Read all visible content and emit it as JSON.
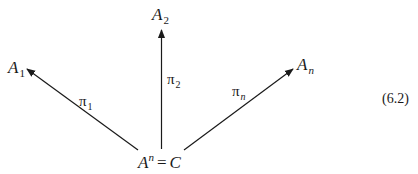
{
  "diagram": {
    "type": "product cone",
    "apex": {
      "base": "A",
      "superscript": "n",
      "equals": "=",
      "rhs": "C"
    },
    "targets": [
      {
        "base": "A",
        "subscript": "1"
      },
      {
        "base": "A",
        "subscript": "2"
      },
      {
        "base": "A",
        "subscript": "n"
      }
    ],
    "projections": [
      {
        "symbol": "π",
        "subscript": "1",
        "from": "AⁿC",
        "to": "A1"
      },
      {
        "symbol": "π",
        "subscript": "2",
        "from": "AⁿC",
        "to": "A2"
      },
      {
        "symbol": "π",
        "subscript": "n",
        "from": "AⁿC",
        "to": "An"
      }
    ],
    "equation_number": "(6.2)",
    "colors": {
      "ink": "#1a1a1a",
      "background": "#ffffff"
    }
  }
}
